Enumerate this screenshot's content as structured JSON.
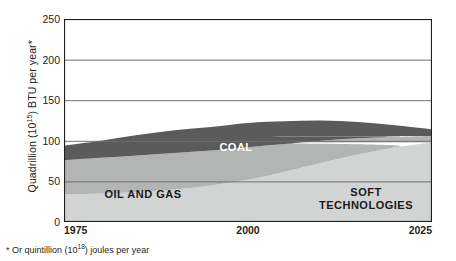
{
  "chart_data": {
    "type": "area",
    "title": "",
    "subtitle": "",
    "xlabel": "",
    "ylabel": "Quadrillion (10^15) BTU per year*",
    "ylabel_prefix": "Quadrillion (10",
    "ylabel_exponent": "15",
    "ylabel_suffix": ") BTU per year*",
    "footnote": "* Or quintillion (10^18) joules per year",
    "footnote_prefix": "* Or quintillion (10",
    "footnote_exponent": "18",
    "footnote_suffix": ") joules per year",
    "stacked": true,
    "grid": true,
    "legend_position": "inline-band-labels",
    "xlim": [
      1975,
      2025
    ],
    "ylim": [
      0,
      250
    ],
    "x_ticks": [
      "1975",
      "2000",
      "2025"
    ],
    "x_tick_values": [
      1975,
      2000,
      2025
    ],
    "y_ticks": [
      "0",
      "50",
      "100",
      "150",
      "200",
      "250"
    ],
    "y_tick_values": [
      0,
      50,
      100,
      150,
      200,
      250
    ],
    "x": [
      1975,
      1980,
      1985,
      1990,
      1995,
      2000,
      2005,
      2010,
      2015,
      2020,
      2025
    ],
    "series": [
      {
        "name": "SOFT TECHNOLOGIES",
        "label": "SOFT\nTECHNOLOGIES",
        "color": "#d2d4d3",
        "text_color": "#1a1a1a",
        "values": [
          34,
          35,
          37,
          40,
          45,
          52,
          62,
          73,
          83,
          92,
          98
        ]
      },
      {
        "name": "OIL AND GAS",
        "label": "OIL AND GAS",
        "color": "#b3b5b4",
        "text_color": "#1a1a1a",
        "values": [
          42,
          44,
          45,
          45,
          43,
          40,
          34,
          27,
          20,
          13,
          8
        ]
      },
      {
        "name": "COAL",
        "label": "COAL",
        "color": "#5b5b5b",
        "text_color": "#ffffff",
        "values": [
          18,
          21,
          25,
          28,
          29,
          30,
          28,
          25,
          20,
          14,
          8
        ]
      }
    ],
    "totals": [
      94,
      100,
      107,
      113,
      117,
      122,
      124,
      125,
      123,
      119,
      114
    ],
    "colors": {
      "coal": "#5b5b5b",
      "oil_and_gas": "#b3b5b4",
      "soft_technologies": "#d2d4d3",
      "axis": "#231f20",
      "grid": "#6d6e70",
      "background": "#ffffff",
      "text": "#231f20"
    }
  }
}
